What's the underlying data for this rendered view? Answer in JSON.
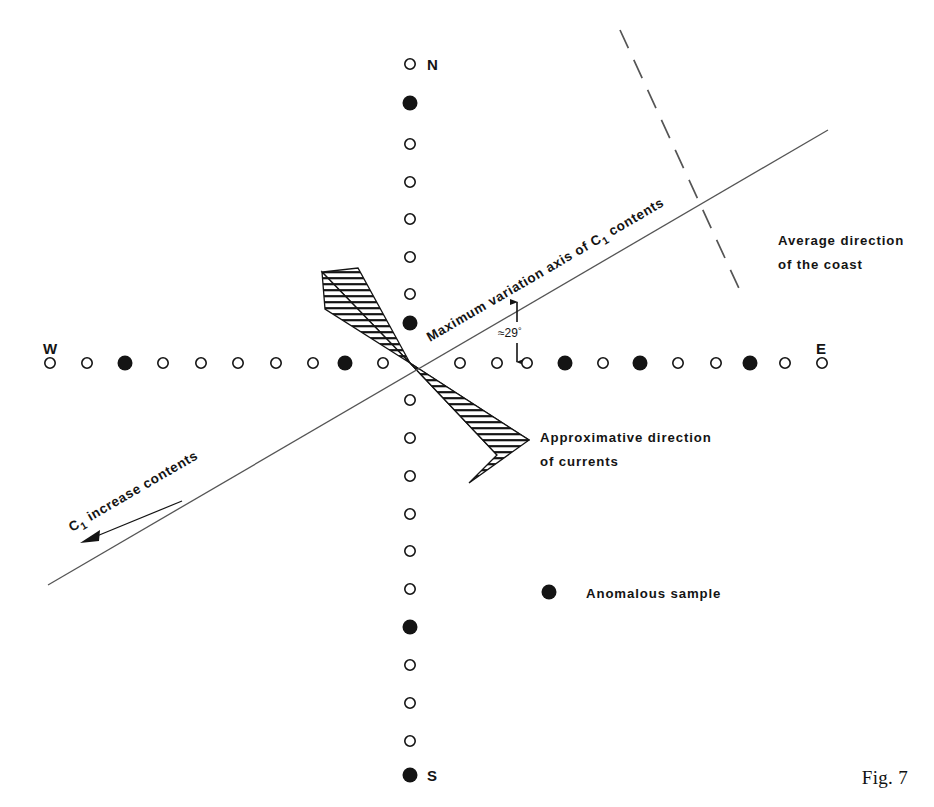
{
  "figure": {
    "caption": "Fig. 7",
    "compass": {
      "north": "N",
      "south": "S",
      "east": "E",
      "west": "W"
    },
    "annotations": {
      "max_axis": "Maximum variation axis of C",
      "max_axis_sub": "1",
      "max_axis_tail": " contents",
      "angle": "≈29",
      "angle_unit": "°",
      "coast_line1": "Average direction",
      "coast_line2": "of the coast",
      "currents_line1": "Approximative direction",
      "currents_line2": "of currents",
      "increase_head": "C",
      "increase_sub": "1",
      "increase_tail": " increase contents"
    },
    "legend": {
      "symbol": "filled-circle",
      "label": "Anomalous sample"
    },
    "colors": {
      "ink": "#141414",
      "line": "#555555",
      "background": "#ffffff"
    }
  },
  "chart_data": {
    "type": "scatter",
    "title": "Fig. 7",
    "xlabel": "",
    "ylabel": "",
    "grid": false,
    "legend_position": "center-right",
    "center": [
      410,
      363
    ],
    "axes": [
      {
        "name": "north-south",
        "orientation": "vertical",
        "endpoints_label": [
          "N",
          "S"
        ],
        "points": [
          {
            "y": 64,
            "type": "open"
          },
          {
            "y": 103,
            "type": "filled"
          },
          {
            "y": 144,
            "type": "open"
          },
          {
            "y": 182,
            "type": "open"
          },
          {
            "y": 219,
            "type": "open"
          },
          {
            "y": 257,
            "type": "open"
          },
          {
            "y": 294,
            "type": "open"
          },
          {
            "y": 323,
            "type": "filled"
          },
          {
            "y": 400,
            "type": "open"
          },
          {
            "y": 438,
            "type": "open"
          },
          {
            "y": 476,
            "type": "open"
          },
          {
            "y": 514,
            "type": "open"
          },
          {
            "y": 551,
            "type": "open"
          },
          {
            "y": 589,
            "type": "open"
          },
          {
            "y": 627,
            "type": "filled"
          },
          {
            "y": 665,
            "type": "open"
          },
          {
            "y": 703,
            "type": "open"
          },
          {
            "y": 741,
            "type": "open"
          },
          {
            "y": 775,
            "type": "filled"
          }
        ]
      },
      {
        "name": "west-east",
        "orientation": "horizontal",
        "endpoints_label": [
          "W",
          "E"
        ],
        "points": [
          {
            "x": 50,
            "type": "open"
          },
          {
            "x": 87,
            "type": "open"
          },
          {
            "x": 125,
            "type": "filled"
          },
          {
            "x": 163,
            "type": "open"
          },
          {
            "x": 201,
            "type": "open"
          },
          {
            "x": 238,
            "type": "open"
          },
          {
            "x": 276,
            "type": "open"
          },
          {
            "x": 313,
            "type": "open"
          },
          {
            "x": 345,
            "type": "filled"
          },
          {
            "x": 383,
            "type": "open"
          },
          {
            "x": 460,
            "type": "open"
          },
          {
            "x": 497,
            "type": "open"
          },
          {
            "x": 527,
            "type": "open"
          },
          {
            "x": 565,
            "type": "filled"
          },
          {
            "x": 603,
            "type": "open"
          },
          {
            "x": 640,
            "type": "filled"
          },
          {
            "x": 678,
            "type": "open"
          },
          {
            "x": 716,
            "type": "open"
          },
          {
            "x": 750,
            "type": "filled"
          },
          {
            "x": 785,
            "type": "open"
          },
          {
            "x": 822,
            "type": "open"
          }
        ]
      }
    ],
    "lines": [
      {
        "name": "maximum-variation-axis",
        "style": "solid",
        "from": [
          48,
          585
        ],
        "to": [
          828,
          130
        ]
      },
      {
        "name": "average-coast-direction",
        "style": "dashed",
        "from": [
          620,
          30
        ],
        "to": [
          742,
          295
        ]
      }
    ],
    "counts": {
      "vertical_points": 19,
      "horizontal_points": 21,
      "anomalous_total": 9
    }
  }
}
